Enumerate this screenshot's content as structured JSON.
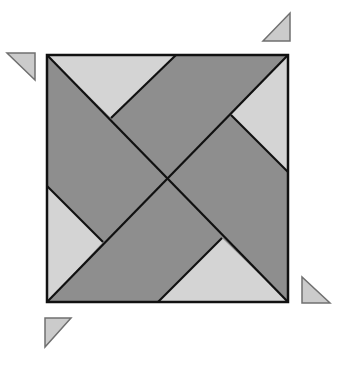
{
  "diagram": {
    "colors": {
      "dark_fill": "#8e8e8e",
      "light_fill": "#d4d4d4",
      "small_fill": "#cbcbcb",
      "stroke": "#111111",
      "small_stroke": "#707070",
      "background": "#ffffff"
    },
    "square": {
      "x1": 47,
      "y1": 55,
      "x2": 288,
      "y2": 302
    },
    "center": {
      "x": 166,
      "y": 179
    },
    "light_triangles": [
      {
        "name": "top",
        "points": "47,55 176,55 111,118"
      },
      {
        "name": "right",
        "points": "288,55 288,172 231,115"
      },
      {
        "name": "bottom",
        "points": "158,302 288,302 222,238"
      },
      {
        "name": "left",
        "points": "47,186 47,302 103,242"
      }
    ],
    "lines": [
      {
        "name": "diagonal-main",
        "x1": 47,
        "y1": 55,
        "x2": 288,
        "y2": 302
      },
      {
        "name": "diagonal-anti",
        "x1": 288,
        "y1": 55,
        "x2": 47,
        "y2": 302
      },
      {
        "name": "cut-top",
        "x1": 176,
        "y1": 55,
        "x2": 111,
        "y2": 118
      },
      {
        "name": "cut-right",
        "x1": 288,
        "y1": 172,
        "x2": 231,
        "y2": 115
      },
      {
        "name": "cut-bottom",
        "x1": 158,
        "y1": 302,
        "x2": 222,
        "y2": 238
      },
      {
        "name": "cut-left",
        "x1": 47,
        "y1": 186,
        "x2": 103,
        "y2": 242
      }
    ],
    "small_triangles": [
      {
        "name": "top-left",
        "points": "7,53 35,53 35,80"
      },
      {
        "name": "top-right",
        "points": "263,41 290,41 290,13"
      },
      {
        "name": "bottom-right",
        "points": "302,277 302,303 330,303"
      },
      {
        "name": "bottom-left",
        "points": "45,318 71,318 45,347"
      }
    ]
  }
}
